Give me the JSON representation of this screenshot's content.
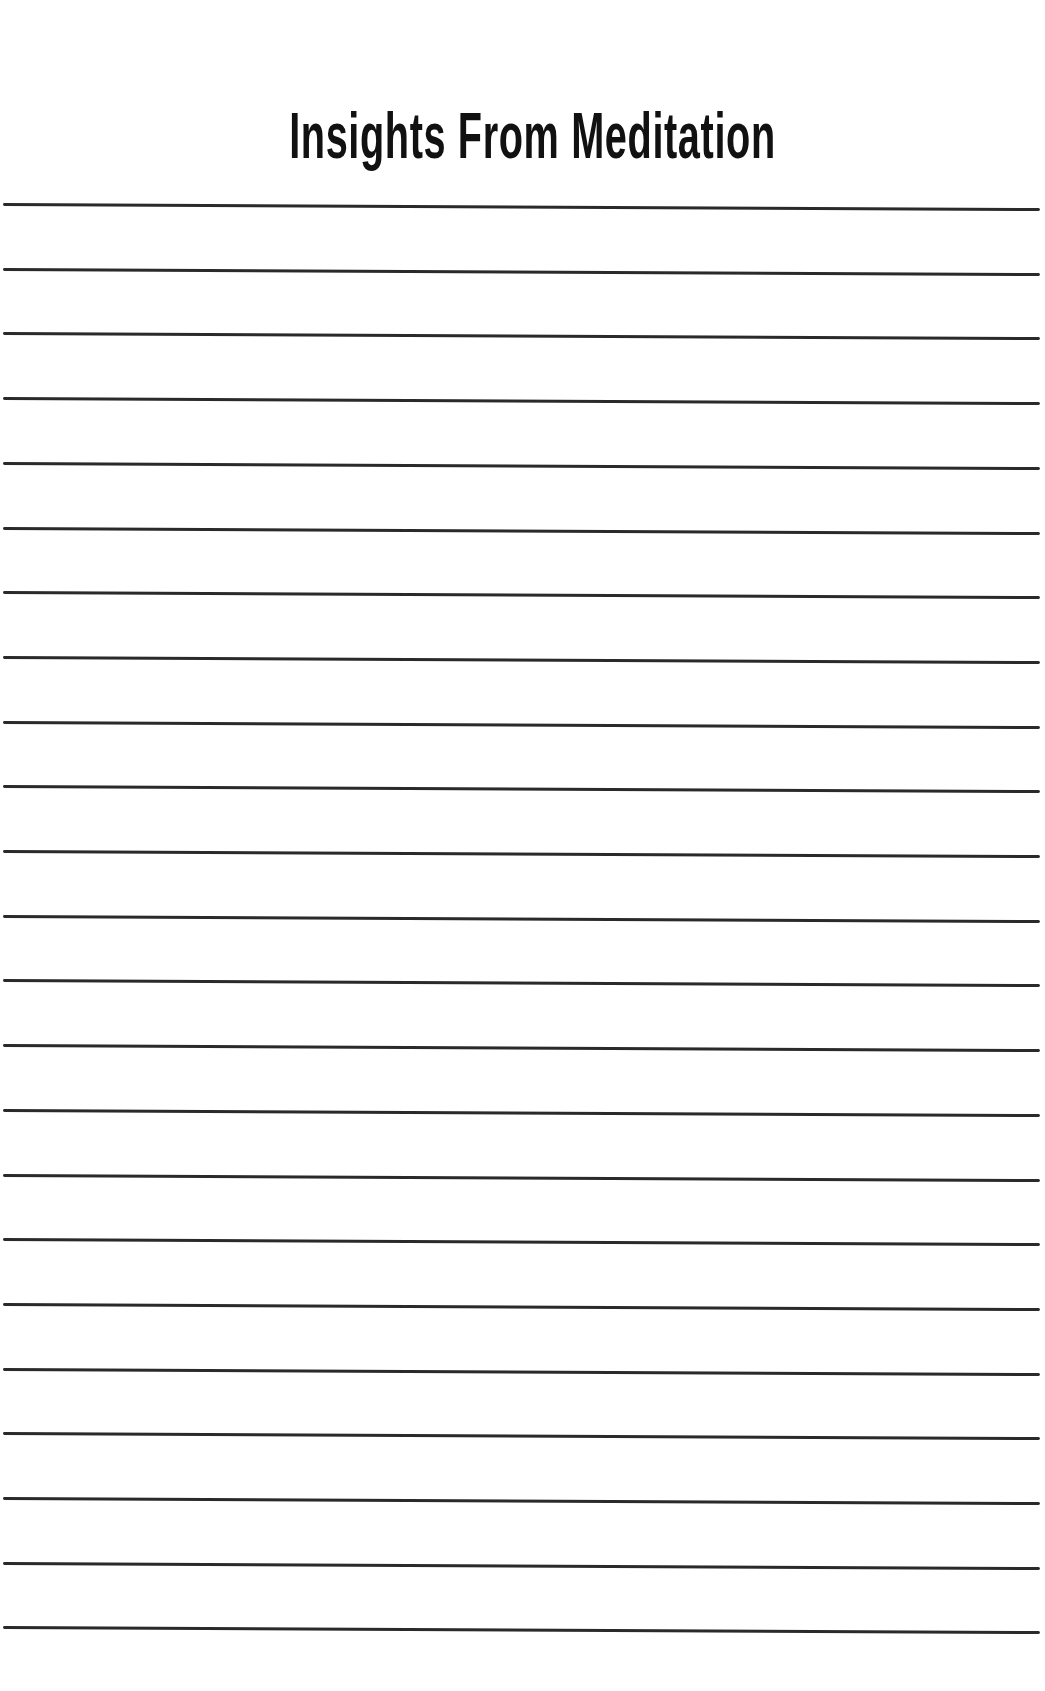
{
  "page": {
    "title": "Insights From Meditation",
    "line_count": 23,
    "first_line_y": 204,
    "line_spacing": 64.7,
    "line_color": "#2a2a2a",
    "background": "#ffffff"
  }
}
